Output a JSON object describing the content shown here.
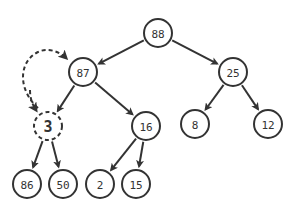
{
  "diagram": {
    "type": "binary-heap-tree",
    "nodes": [
      {
        "id": "n88",
        "label": "88",
        "x": 158,
        "y": 33
      },
      {
        "id": "n87",
        "label": "87",
        "x": 83,
        "y": 72
      },
      {
        "id": "n25",
        "label": "25",
        "x": 233,
        "y": 72
      },
      {
        "id": "n3",
        "label": "3",
        "x": 48,
        "y": 126,
        "highlight": true
      },
      {
        "id": "n16",
        "label": "16",
        "x": 146,
        "y": 126
      },
      {
        "id": "n8",
        "label": "8",
        "x": 195,
        "y": 124
      },
      {
        "id": "n12",
        "label": "12",
        "x": 268,
        "y": 124
      },
      {
        "id": "n86",
        "label": "86",
        "x": 27,
        "y": 184
      },
      {
        "id": "n50",
        "label": "50",
        "x": 63,
        "y": 184
      },
      {
        "id": "n2",
        "label": "2",
        "x": 100,
        "y": 184
      },
      {
        "id": "n15",
        "label": "15",
        "x": 136,
        "y": 184
      }
    ],
    "edges": [
      {
        "from": "n88",
        "to": "n87"
      },
      {
        "from": "n88",
        "to": "n25"
      },
      {
        "from": "n87",
        "to": "n3"
      },
      {
        "from": "n87",
        "to": "n16"
      },
      {
        "from": "n25",
        "to": "n8"
      },
      {
        "from": "n25",
        "to": "n12"
      },
      {
        "from": "n3",
        "to": "n86"
      },
      {
        "from": "n3",
        "to": "n50"
      },
      {
        "from": "n16",
        "to": "n2"
      },
      {
        "from": "n16",
        "to": "n15"
      }
    ],
    "swap_arrow": {
      "between": [
        "n3",
        "n87"
      ],
      "style": "dashed",
      "bidirectional": true
    }
  }
}
